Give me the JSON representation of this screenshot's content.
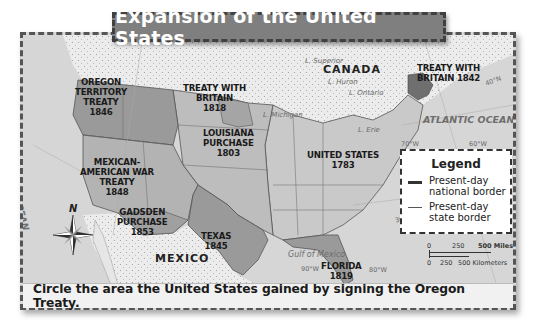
{
  "title": "Expansion of the United States",
  "regions": [
    {
      "name": "OREGON TERRITORY TREATY",
      "year": "1846",
      "lines": [
        "OREGON",
        "TERRITORY",
        "TREATY",
        "1846"
      ]
    },
    {
      "name": "TREATY WITH BRITAIN",
      "year": "1818",
      "lines": [
        "TREATY WITH",
        "BRITAIN",
        "1818"
      ]
    },
    {
      "name": "LOUISIANA PURCHASE",
      "year": "1803",
      "lines": [
        "LOUISIANA",
        "PURCHASE",
        "1803"
      ]
    },
    {
      "name": "MEXICAN-AMERICAN WAR TREATY",
      "year": "1848",
      "lines": [
        "MEXICAN-",
        "AMERICAN WAR",
        "TREATY",
        "1848"
      ]
    },
    {
      "name": "UNITED STATES",
      "year": "1783",
      "lines": [
        "UNITED STATES",
        "1783"
      ]
    },
    {
      "name": "GADSDEN PURCHASE",
      "year": "1853",
      "lines": [
        "GADSDEN",
        "PURCHASE",
        "1853"
      ]
    },
    {
      "name": "TEXAS",
      "year": "1845",
      "lines": [
        "TEXAS",
        "1845"
      ]
    },
    {
      "name": "FLORIDA",
      "year": "1819",
      "lines": [
        "FLORIDA",
        "1819"
      ]
    },
    {
      "name": "TREATY WITH BRITAIN 1842",
      "year": "1842",
      "lines": [
        "TREATY WITH",
        "BRITAIN 1842"
      ]
    }
  ],
  "countries": {
    "canada": "CANADA",
    "mexico": "MEXICO"
  },
  "water": {
    "pacific": "PACIFIC OCEAN",
    "atlantic": "ATLANTIC OCEAN",
    "gulf": "Gulf of Mexico"
  },
  "lakes": {
    "superior": "L. Superior",
    "huron": "L. Huron",
    "ontario": "L. Ontario",
    "michigan": "L. Michigan",
    "erie": "L. Erie"
  },
  "coordinates": {
    "lon_120": "120°W",
    "lon_110": "110°W",
    "lon_90": "90°W",
    "lon_80": "80°W",
    "lon_70": "70°W",
    "lon_60": "60°W",
    "lat_40": "40°N",
    "lat_30": "30°N"
  },
  "compass": {
    "north": "N"
  },
  "legend": {
    "title": "Legend",
    "items": [
      {
        "label_line1": "Present-day",
        "label_line2": "national border",
        "style": "thick"
      },
      {
        "label_line1": "Present-day",
        "label_line2": "state border",
        "style": "thin"
      }
    ]
  },
  "scale": {
    "miles": {
      "zero": "0",
      "mid": "250",
      "end": "500 Miles"
    },
    "km": {
      "zero": "0",
      "mid": "250",
      "end": "500 Kilometers"
    }
  },
  "caption": "Circle the area the United States gained by signing the Oregon Treaty.",
  "colors": {
    "ocean": "#d6d6d6",
    "foreign_land": "#e6e6e6",
    "us_1783": "#c9c9c9",
    "acquisition_dark": "#9a9a9a",
    "acquisition_mid": "#b3b3b3",
    "title_bg": "#7f7f7f"
  }
}
